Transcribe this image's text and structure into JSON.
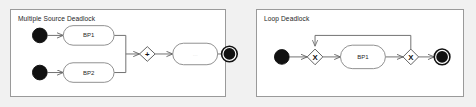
{
  "canvas": {
    "width": 476,
    "height": 107,
    "background": "#f1f1f1"
  },
  "panels": [
    {
      "id": "multiple-source-deadlock",
      "title": "Multiple Source Deadlock",
      "nodes": {
        "start_1": "start-event",
        "start_2": "start-event",
        "task_bp1": "BP1",
        "task_bp2": "BP2",
        "gateway_join": "+",
        "task_unnamed": "...",
        "end_1": "end-event"
      }
    },
    {
      "id": "loop-deadlock",
      "title": "Loop Deadlock",
      "nodes": {
        "start_1": "start-event",
        "gateway_left": "X",
        "task_bp1": "BP1",
        "gateway_right": "X",
        "end_1": "end-event"
      }
    }
  ],
  "colors": {
    "page_background": "#f1f1f1",
    "panel_background": "#ffffff",
    "panel_border": "#9a9a9a",
    "flow_line": "#6f6f6f",
    "task_border": "#8e8e8e",
    "gateway_border": "#5e5e5e",
    "event_fill": "#111111",
    "text": "#1e1e1e"
  }
}
